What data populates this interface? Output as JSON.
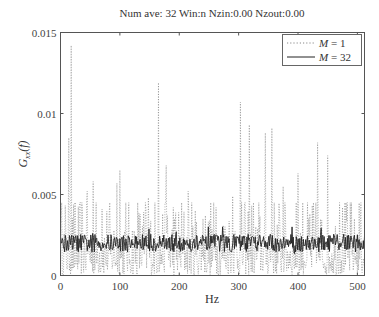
{
  "chart_data": {
    "type": "line",
    "title": "Num ave: 32 Win:n Nzin:0.00 Nzout:0.00",
    "xlabel": "Hz",
    "ylabel": "G_xx(f)",
    "ylabel_display": {
      "main": "G",
      "sub": "xx",
      "arg": "(f)"
    },
    "xlim": [
      0,
      512
    ],
    "ylim": [
      0,
      0.015
    ],
    "xticks": [
      0,
      100,
      200,
      300,
      400,
      500
    ],
    "xtick_labels": [
      "0",
      "100",
      "200",
      "300",
      "400",
      "500"
    ],
    "yticks": [
      0,
      0.005,
      0.01,
      0.015
    ],
    "ytick_labels": [
      "0",
      "0.005",
      "0.01",
      "0.015"
    ],
    "grid": false,
    "legend_position": "upper right",
    "series": [
      {
        "name": "M = 1",
        "legend_var": "M",
        "legend_value": "= 1",
        "style": "dotted",
        "color": "#777777",
        "mean_level": 0.002,
        "description": "Single-record PSD estimate; highly variable, spiky, ranging 0 to ~0.014",
        "peaks": [
          {
            "x": 14,
            "y": 0.0085
          },
          {
            "x": 18,
            "y": 0.0142
          },
          {
            "x": 25,
            "y": 0.0045
          },
          {
            "x": 45,
            "y": 0.0052
          },
          {
            "x": 55,
            "y": 0.0058
          },
          {
            "x": 70,
            "y": 0.0041
          },
          {
            "x": 95,
            "y": 0.0057
          },
          {
            "x": 100,
            "y": 0.0065
          },
          {
            "x": 130,
            "y": 0.0045
          },
          {
            "x": 148,
            "y": 0.0048
          },
          {
            "x": 165,
            "y": 0.0119
          },
          {
            "x": 178,
            "y": 0.0068
          },
          {
            "x": 190,
            "y": 0.0042
          },
          {
            "x": 215,
            "y": 0.0052
          },
          {
            "x": 240,
            "y": 0.0035
          },
          {
            "x": 262,
            "y": 0.0042
          },
          {
            "x": 290,
            "y": 0.0049
          },
          {
            "x": 303,
            "y": 0.0107
          },
          {
            "x": 318,
            "y": 0.0093
          },
          {
            "x": 345,
            "y": 0.0088
          },
          {
            "x": 356,
            "y": 0.0091
          },
          {
            "x": 375,
            "y": 0.0055
          },
          {
            "x": 400,
            "y": 0.0063
          },
          {
            "x": 420,
            "y": 0.0038
          },
          {
            "x": 433,
            "y": 0.0082
          },
          {
            "x": 450,
            "y": 0.0074
          },
          {
            "x": 470,
            "y": 0.0045
          },
          {
            "x": 495,
            "y": 0.0035
          },
          {
            "x": 505,
            "y": 0.0032
          }
        ]
      },
      {
        "name": "M = 32",
        "legend_var": "M",
        "legend_value": "= 32",
        "style": "solid",
        "color": "#222222",
        "mean_level": 0.002,
        "description": "32-average PSD estimate; smooth band fluctuating ~0.0015 to ~0.003 around 0.002",
        "range": [
          0.0013,
          0.003
        ]
      }
    ]
  }
}
